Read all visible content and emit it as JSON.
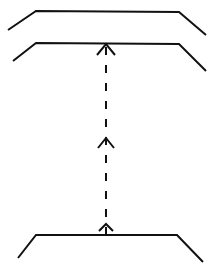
{
  "diagram": {
    "background": "#ffffff",
    "stroke_color": "#111111",
    "stroke_width": 2,
    "surfaces": [
      {
        "name": "top-surface",
        "points": "8,30 36,11 179,12 206,35"
      },
      {
        "name": "middle-surface",
        "points": "13,61 36,43 179,44 206,71"
      },
      {
        "name": "bottom-surface",
        "points": "18,258 36,235 177,235 203,262"
      }
    ],
    "connector": {
      "style": "dashed",
      "direction": "up",
      "x": 106,
      "y_start": 235,
      "y_end": 44,
      "dasharray": "8,10"
    },
    "arrowheads": [
      {
        "name": "top-arrowhead",
        "tip_x": 106,
        "tip_y": 44,
        "half_width": 9,
        "depth": 11
      },
      {
        "name": "middle-arrowhead",
        "tip_x": 106,
        "tip_y": 138,
        "half_width": 8,
        "depth": 10
      },
      {
        "name": "bottom-arrowhead",
        "tip_x": 106,
        "tip_y": 224,
        "half_width": 7,
        "depth": 7
      }
    ]
  }
}
